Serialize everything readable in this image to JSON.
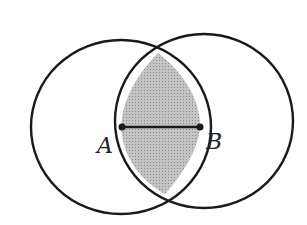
{
  "diagram": {
    "title": "",
    "labels": {
      "A": "A",
      "B": "B"
    },
    "colors": {
      "stroke": "#1a1a1a",
      "shade": "#bdbdbd",
      "background": "#ffffff"
    },
    "shapes": {
      "circle_A": {
        "cx": 121,
        "cy": 127,
        "rx": 90,
        "ry": 87
      },
      "circle_B": {
        "cx": 204,
        "cy": 121,
        "rx": 89,
        "ry": 87
      },
      "segment_AB": {
        "x1": 122,
        "y1": 127,
        "x2": 200,
        "y2": 127
      },
      "intersection_top": [
        158,
        53
      ],
      "intersection_bottom": [
        165,
        194
      ]
    }
  }
}
